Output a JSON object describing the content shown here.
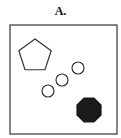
{
  "figure": {
    "label": "A.",
    "frame": {
      "x": 10,
      "y": 25,
      "width": 107,
      "height": 109,
      "stroke": "#444444"
    },
    "shapes": [
      {
        "type": "pentagon",
        "cx": 35,
        "cy": 56,
        "r": 17,
        "fill": "none",
        "stroke": "#333333"
      },
      {
        "type": "circle",
        "cx": 48,
        "cy": 91,
        "r": 6,
        "fill": "none",
        "stroke": "#333333"
      },
      {
        "type": "circle",
        "cx": 62,
        "cy": 80,
        "r": 6,
        "fill": "none",
        "stroke": "#333333"
      },
      {
        "type": "circle",
        "cx": 78,
        "cy": 68,
        "r": 6,
        "fill": "none",
        "stroke": "#333333"
      },
      {
        "type": "octagon",
        "cx": 89,
        "cy": 110,
        "r": 13,
        "fill": "#1a1a1a",
        "stroke": "#1a1a1a"
      }
    ]
  }
}
